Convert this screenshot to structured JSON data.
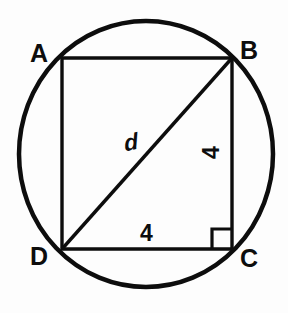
{
  "figure": {
    "type": "geometry-diagram",
    "background_color": "#fdfdfd",
    "stroke_color": "#0d0d0d",
    "circle": {
      "center_x": 146,
      "center_y": 154,
      "radius_x": 127,
      "radius_y": 133,
      "stroke_width": 4.5
    },
    "square": {
      "left": 62,
      "top": 58,
      "right": 232,
      "bottom": 249,
      "stroke_width": 3.4
    },
    "diagonal": {
      "x1": 62,
      "y1": 249,
      "x2": 232,
      "y2": 58,
      "stroke_width": 3.4
    },
    "right_angle_marker": {
      "size": 20,
      "corner": "C",
      "stroke_width": 3.2
    },
    "vertices": [
      {
        "id": "A",
        "label": "A",
        "x": 62,
        "y": 58
      },
      {
        "id": "B",
        "label": "B",
        "x": 232,
        "y": 58
      },
      {
        "id": "C",
        "label": "C",
        "x": 232,
        "y": 249
      },
      {
        "id": "D",
        "label": "D",
        "x": 62,
        "y": 249
      }
    ],
    "measurements": [
      {
        "id": "side-right",
        "label": "4",
        "side": "BC",
        "orientation": "vertical"
      },
      {
        "id": "side-bottom",
        "label": "4",
        "side": "DC",
        "orientation": "horizontal"
      },
      {
        "id": "diagonal",
        "label": "d",
        "side": "DB",
        "orientation": "diagonal"
      }
    ]
  }
}
